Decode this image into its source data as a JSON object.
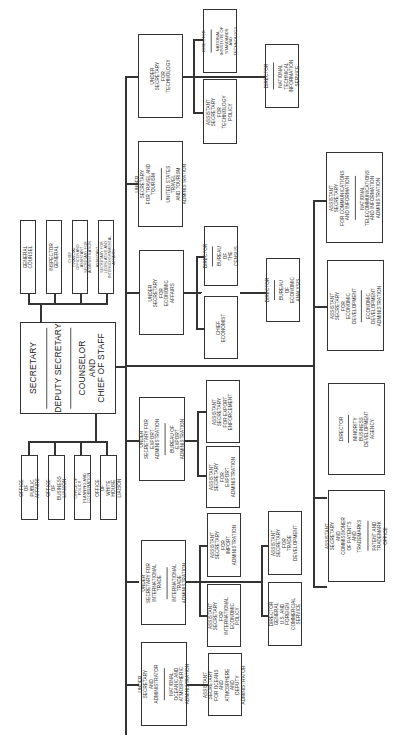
{
  "chart_title": "",
  "secretary_box": {
    "lines": [
      "SECRETARY",
      "DEPUTY SECRETARY",
      "COUNSELOR\nAND\nCHIEF OF STAFF"
    ]
  },
  "staff_offices_top": [
    "GENERAL COUNSEL",
    "INSPECTOR GENERAL",
    "CHIEF FINANCIAL OFFICER AND\nASSISTANT SECRETARY FOR\nADMINISTRATION",
    "ASSISTANT SECRETARY FOR\nLEGISLATIVE AND\nINTERGOVERNMENTAL AFFAIRS"
  ],
  "staff_offices_bottom": [
    "OFFICE OF PUBLIC AFFAIRS",
    "OFFICE OF BUSINESS LIAISON",
    "OFFICE OF POLICY\nPLANNING AND COORDINATION",
    "OFFICE OF\nWHITE HOUSE LIAISON"
  ],
  "under_secretaries": {
    "technology": {
      "title": "UNDER SECRETARY\nFOR\nTECHNOLOGY",
      "sub": ""
    },
    "travel": {
      "title": "UNDER SECRETARY\nFOR TRAVEL AND TOURISM",
      "sub": "UNITED STATES TRAVEL\nAND TOURISM ADMINISTRATION"
    },
    "economic": {
      "title": "UNDER SECRETARY\nFOR\nECONOMIC AFFAIRS",
      "sub": ""
    },
    "export": {
      "title": "UNDER SECRETARY FOR\nEXPORT ADMINISTRATION",
      "sub": "BUREAU OF\nEXPORT ADMINISTRATION"
    },
    "trade": {
      "title": "UNDER SECRETARY FOR\nINTERNATIONAL TRADE",
      "sub": "INTERNATIONAL TRADE\nADMINISTRATION"
    },
    "oceans": {
      "title": "UNDER SECRETARY\nAND ADMINISTRATOR",
      "sub": "NATIONAL OCEANIC AND\nATMOSPHERIC ADMINISTRATION"
    }
  },
  "sub_units": {
    "nist": {
      "title": "DIRECTOR",
      "sub": "NATIONAL INSTITUTE OF\nSTANDARDS AND\nTECHNOLOGY"
    },
    "tech_policy": {
      "title": "ASSISTANT SECRETARY\nFOR\nTECHNOLOGY POLICY",
      "sub": ""
    },
    "ntis": {
      "title": "DIRECTOR",
      "sub": "NATIONAL TECHNICAL\nINFORMATION SERVICE"
    },
    "census": {
      "title": "DIRECTOR",
      "sub": "BUREAU OF\nTHE CENSUS"
    },
    "chief_economist": {
      "title": "CHIEF ECONOMIST",
      "sub": ""
    },
    "bea": {
      "title": "DIRECTOR",
      "sub": "BUREAU OF\nECONOMIC ANALYSIS"
    },
    "export_enforcement": {
      "title": "ASSISTANT SECRETARY\nFOR EXPORT\nENFORCEMENT",
      "sub": ""
    },
    "export_admin": {
      "title": "ASSISTANT SECRETARY\nFOR\nEXPORT ADMINISTRATION",
      "sub": ""
    },
    "import_admin": {
      "title": "ASSISTANT SECRETARY\nFOR\nIMPORT ADMINISTRATION",
      "sub": ""
    },
    "intl_econ_policy": {
      "title": "ASSISTANT SECRETARY\nFOR INTERNATIONAL\nECONOMIC POLICY",
      "sub": ""
    },
    "trade_dev": {
      "title": "ASSISTANT SECRETARY\nFOR\nTRADE DEVELOPMENT",
      "sub": ""
    },
    "commercial_service": {
      "title": "DIRECTOR GENERAL\nU.S. AND FOREIGN\nCOMMERCIAL SERVICE",
      "sub": ""
    },
    "oceans_deputy": {
      "title": "ASSISTANT SECRETARY\nFOR OCEANS AND\nATMOSPHERE AND\nDEPUTY ADMINISTRATOR",
      "sub": ""
    }
  },
  "assistant_secretaries_lower": {
    "ntia": {
      "title": "ASSISTANT SECRETARY\nFOR COMMUNICATIONS\nAND INFORMATION",
      "sub": "NATIONAL TELECOMMUNICATIONS\nAND INFORMATION ADMINISTRATION"
    },
    "eda": {
      "title": "ASSISTANT SECRETARY\nFOR\nECONOMIC DEVELOPMENT",
      "sub": "ECONOMIC DEVELOPMENT\nADMINISTRATION"
    },
    "mbda": {
      "title": "DIRECTOR",
      "sub": "MINORITY BUSINESS\nDEVELOPMENT AGENCY"
    },
    "pto": {
      "title": "ASSISTANT SECRETARY AND\nCOMMISSIONER OF PATENTS\nAND TRADEMARKS",
      "sub": "PATENT AND\nTRADEMARK\nOFFICE"
    }
  }
}
